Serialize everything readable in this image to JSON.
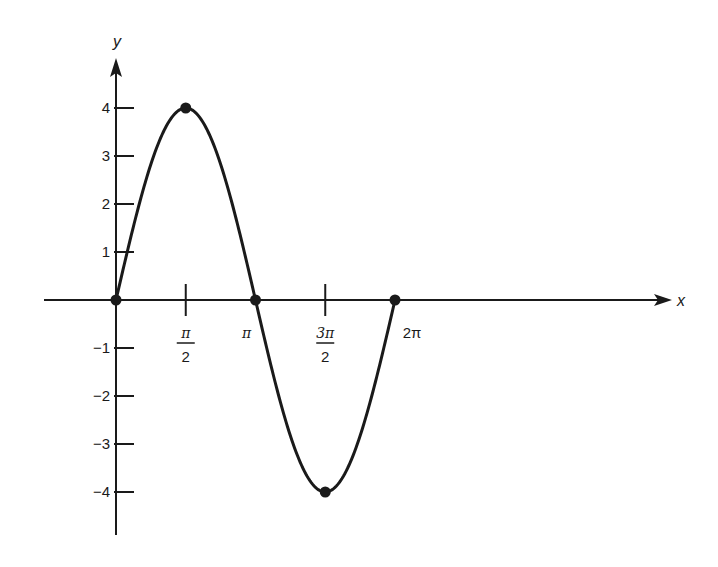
{
  "chart_data": {
    "type": "line",
    "title": "",
    "function": "y = 4 sin x",
    "xlabel": "x",
    "ylabel": "y",
    "x_ticks": [
      {
        "value": 1.5708,
        "label_num": "π",
        "label_den": "2"
      },
      {
        "value": 3.1416,
        "label": "π"
      },
      {
        "value": 4.7124,
        "label_num": "3π",
        "label_den": "2"
      },
      {
        "value": 6.2832,
        "label": "2π"
      }
    ],
    "y_ticks": [
      {
        "value": 4,
        "label": "4"
      },
      {
        "value": 3,
        "label": "3"
      },
      {
        "value": 2,
        "label": "2"
      },
      {
        "value": 1,
        "label": "1"
      },
      {
        "value": -1,
        "label": "−1"
      },
      {
        "value": -2,
        "label": "−2"
      },
      {
        "value": -3,
        "label": "−3"
      },
      {
        "value": -4,
        "label": "−4"
      }
    ],
    "xlim": [
      -1.6,
      12.6
    ],
    "ylim": [
      -4.9,
      5.1
    ],
    "grid": false,
    "legend": null,
    "series": [
      {
        "name": "4 sin x",
        "x": [
          0,
          0.7854,
          1.5708,
          2.3562,
          3.1416,
          3.927,
          4.7124,
          5.4978,
          6.2832
        ],
        "y": [
          0,
          2.83,
          4,
          2.83,
          0,
          -2.83,
          -4,
          -2.83,
          0
        ]
      }
    ],
    "marked_points": [
      {
        "x": 0,
        "y": 0
      },
      {
        "x": 1.5708,
        "y": 4
      },
      {
        "x": 3.1416,
        "y": 0
      },
      {
        "x": 4.7124,
        "y": -4
      },
      {
        "x": 6.2832,
        "y": 0
      }
    ]
  },
  "style": {
    "ink_color": "#1a1a1a",
    "background": "#ffffff"
  }
}
